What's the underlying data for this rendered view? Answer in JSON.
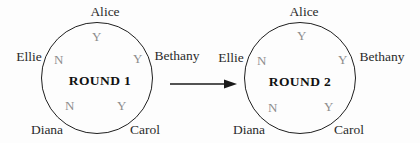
{
  "diagram": {
    "rounds": [
      {
        "title": "ROUND 1",
        "participants": [
          {
            "name": "Alice",
            "vote": "Y",
            "position": "top"
          },
          {
            "name": "Bethany",
            "vote": "Y",
            "position": "right"
          },
          {
            "name": "Carol",
            "vote": "Y",
            "position": "bottom-right"
          },
          {
            "name": "Diana",
            "vote": "N",
            "position": "bottom-left"
          },
          {
            "name": "Ellie",
            "vote": "N",
            "position": "left"
          }
        ]
      },
      {
        "title": "ROUND 2",
        "participants": [
          {
            "name": "Alice",
            "vote": "Y",
            "position": "top"
          },
          {
            "name": "Bethany",
            "vote": "Y",
            "position": "right"
          },
          {
            "name": "Carol",
            "vote": "Y",
            "position": "bottom-right"
          },
          {
            "name": "Diana",
            "vote": "N",
            "position": "bottom-left"
          },
          {
            "name": "Ellie",
            "vote": "N",
            "position": "left"
          }
        ]
      }
    ],
    "colors": {
      "circle_stroke": "#1f1f1f",
      "name_text": "#2b2b2b",
      "vote_text": "#8d8d8d",
      "title_text": "#111111",
      "background": "#fdfdfd"
    }
  }
}
